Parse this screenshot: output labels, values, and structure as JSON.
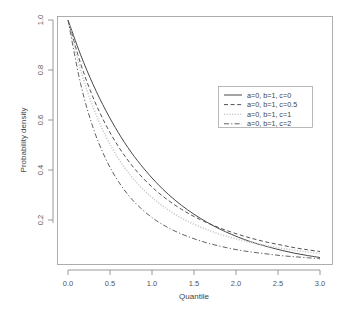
{
  "chart_data": {
    "type": "line",
    "title": "",
    "xlabel": "Quantile",
    "ylabel": "Probability density",
    "xlim": [
      0,
      3.0
    ],
    "ylim": [
      0.0,
      1.0
    ],
    "grid": false,
    "legend_position": "right",
    "xticks": [
      "0.0",
      "0.5",
      "1.0",
      "1.5",
      "2.0",
      "2.5",
      "3.0"
    ],
    "xtick_values": [
      0.0,
      0.5,
      1.0,
      1.5,
      2.0,
      2.5,
      3.0
    ],
    "yticks": [
      "0.2",
      "0.4",
      "0.6",
      "0.8",
      "1.0"
    ],
    "ytick_values": [
      0.2,
      0.4,
      0.6,
      0.8,
      1.0
    ],
    "x": [
      0.0,
      0.15,
      0.3,
      0.45,
      0.6,
      0.75,
      0.9,
      1.05,
      1.2,
      1.35,
      1.5,
      1.65,
      1.8,
      1.95,
      2.1,
      2.25,
      2.4,
      2.55,
      2.7,
      2.85,
      3.0
    ],
    "series": [
      {
        "name": "a=0, b=1, c=0",
        "style": "solid",
        "color": "#3d3d3d",
        "values": [
          1.0,
          0.861,
          0.741,
          0.638,
          0.549,
          0.472,
          0.407,
          0.35,
          0.301,
          0.259,
          0.223,
          0.192,
          0.165,
          0.142,
          0.122,
          0.105,
          0.091,
          0.078,
          0.067,
          0.058,
          0.05
        ]
      },
      {
        "name": "a=0, b=1, c=0.5",
        "style": "dashed",
        "color": "#4a4a4a",
        "values": [
          1.0,
          0.826,
          0.689,
          0.581,
          0.494,
          0.423,
          0.365,
          0.317,
          0.277,
          0.243,
          0.214,
          0.19,
          0.169,
          0.151,
          0.135,
          0.121,
          0.109,
          0.099,
          0.089,
          0.081,
          0.074
        ]
      },
      {
        "name": "a=0, b=1, c=1",
        "style": "dotted",
        "color": "#c8c8c8",
        "values": [
          1.0,
          0.8,
          0.65,
          0.535,
          0.446,
          0.376,
          0.321,
          0.276,
          0.239,
          0.208,
          0.183,
          0.162,
          0.144,
          0.129,
          0.116,
          0.105,
          0.095,
          0.086,
          0.079,
          0.072,
          0.066
        ]
      },
      {
        "name": "a=0, b=1, c=2",
        "style": "dashdot",
        "color": "#5a5a5a",
        "values": [
          1.0,
          0.745,
          0.568,
          0.444,
          0.354,
          0.287,
          0.237,
          0.198,
          0.168,
          0.144,
          0.125,
          0.109,
          0.096,
          0.085,
          0.076,
          0.069,
          0.063,
          0.057,
          0.053,
          0.049,
          0.045
        ]
      }
    ]
  },
  "legend": {
    "entries": [
      {
        "label": "a=0, b=1, c=0"
      },
      {
        "label": "a=0, b=1, c=0.5"
      },
      {
        "label": "a=0, b=1, c=1"
      },
      {
        "label": "a=0, b=1, c=2"
      }
    ]
  },
  "axes": {
    "x_title": "Quantile",
    "y_title": "Probability density"
  }
}
